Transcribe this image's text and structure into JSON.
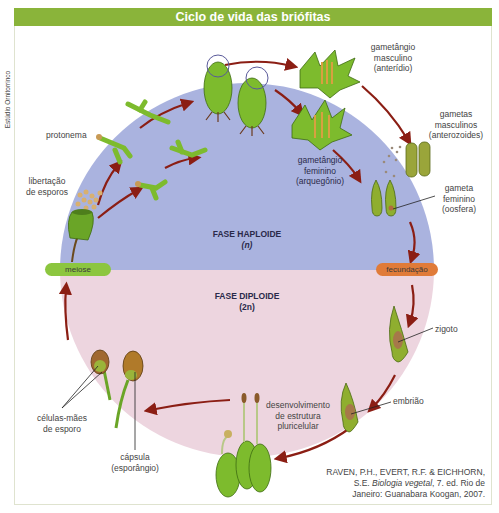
{
  "title": "Ciclo de vida das briófitas",
  "credit": "Estúdio Ornitorrinco",
  "phases": {
    "haploid": {
      "name": "FASE HAPLOIDE",
      "ploidy": "(n)"
    },
    "diploid": {
      "name": "FASE DIPLOIDE",
      "ploidy": "(2n)"
    }
  },
  "transitions": {
    "meiosis": "meiose",
    "fertilization": "fecundação"
  },
  "labels": {
    "protonema": "protonema",
    "spore_release_1": "libertação",
    "spore_release_2": "de esporos",
    "male_gametangium_1": "gametângio",
    "male_gametangium_2": "masculino",
    "male_gametangium_3": "(anterídio)",
    "male_gametes_1": "gametas",
    "male_gametes_2": "masculinos",
    "male_gametes_3": "(anterozoides)",
    "female_gametangium_1": "gametângio",
    "female_gametangium_2": "feminino",
    "female_gametangium_3": "(arquegônio)",
    "female_gamete_1": "gameta",
    "female_gamete_2": "feminino",
    "female_gamete_3": "(oosfera)",
    "zygote": "zigoto",
    "embryo": "embrião",
    "development_1": "desenvolvimento",
    "development_2": "de estrutura",
    "development_3": "pluricelular",
    "spore_mother_cells_1": "células-mães",
    "spore_mother_cells_2": "de esporo",
    "capsule_1": "cápsula",
    "capsule_2": "(esporângio)"
  },
  "reference": {
    "line1": "RAVEN, P.H., EVERT, R.F. & EICHHORN,",
    "line2_pre": "S.E.",
    "line2_title": "Biologia vegetal",
    "line2_post": ", 7. ed. Rio de",
    "line3": "Janeiro: Guanabara Koogan, 2007."
  },
  "colors": {
    "title_bar": "#8ab43a",
    "haploid_bg": "#aab3df",
    "diploid_bg": "#edd5df",
    "meiosis_pill": "#8cc63f",
    "fertilization_pill": "#e07b39",
    "arrow": "#8b1e14",
    "plant_green": "#6aa527"
  }
}
